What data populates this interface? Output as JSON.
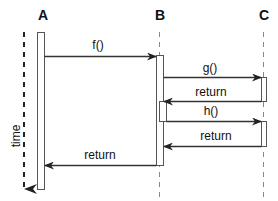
{
  "diagram": {
    "type": "sequence",
    "time_axis_label": "time",
    "participants": [
      {
        "id": "A",
        "label": "A",
        "x": 41
      },
      {
        "id": "B",
        "label": "B",
        "x": 159
      },
      {
        "id": "C",
        "label": "C",
        "x": 263
      }
    ],
    "messages": [
      {
        "from": "A",
        "to": "B",
        "label": "f()",
        "kind": "call",
        "y": 56
      },
      {
        "from": "B",
        "to": "C",
        "label": "g()",
        "kind": "call",
        "y": 77
      },
      {
        "from": "C",
        "to": "B",
        "label": "return",
        "kind": "return",
        "y": 101
      },
      {
        "from": "B",
        "to": "C",
        "label": "h()",
        "kind": "call",
        "y": 121
      },
      {
        "from": "C",
        "to": "B",
        "label": "return",
        "kind": "return",
        "y": 146
      },
      {
        "from": "B",
        "to": "A",
        "label": "return",
        "kind": "return",
        "y": 165
      }
    ],
    "colors": {
      "line": "#333333",
      "box_stroke": "#555555",
      "lifeline": "#777777"
    }
  }
}
